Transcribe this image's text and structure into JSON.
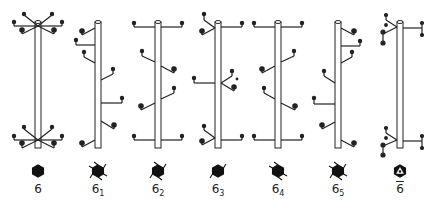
{
  "colors": {
    "stroke": "#222222",
    "background": "#ffffff",
    "pole_fill": "#ffffff"
  },
  "columns": [
    {
      "id": "6",
      "label_main": "6",
      "label_sub": "",
      "bar": false,
      "x": 38,
      "type": "rotation"
    },
    {
      "id": "6_1",
      "label_main": "6",
      "label_sub": "1",
      "bar": false,
      "x": 98,
      "type": "screw"
    },
    {
      "id": "6_2",
      "label_main": "6",
      "label_sub": "2",
      "bar": false,
      "x": 158,
      "type": "screw"
    },
    {
      "id": "6_3",
      "label_main": "6",
      "label_sub": "3",
      "bar": false,
      "x": 218,
      "type": "screw"
    },
    {
      "id": "6_4",
      "label_main": "6",
      "label_sub": "4",
      "bar": false,
      "x": 278,
      "type": "screw"
    },
    {
      "id": "6_5",
      "label_main": "6",
      "label_sub": "5",
      "bar": false,
      "x": 338,
      "type": "screw"
    },
    {
      "id": "6_bar",
      "label_main": "6",
      "label_sub": "",
      "bar": true,
      "x": 400,
      "type": "rotoinversion"
    }
  ]
}
